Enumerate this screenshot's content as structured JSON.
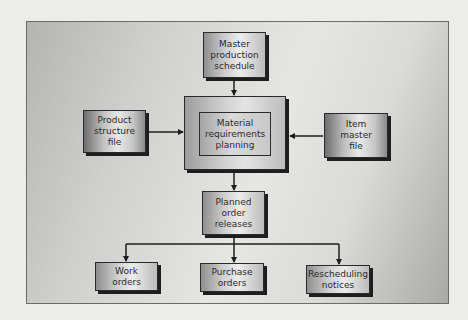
{
  "diagram": {
    "type": "flowchart",
    "title": "",
    "nodes": [
      {
        "id": "mps",
        "label": "Master\nproduction\nschedule"
      },
      {
        "id": "mrp",
        "label": "Material\nrequirements\nplanning"
      },
      {
        "id": "psf",
        "label": "Product\nstructure\nfile"
      },
      {
        "id": "imf",
        "label": "Item\nmaster\nfile"
      },
      {
        "id": "por",
        "label": "Planned\norder\nreleases"
      },
      {
        "id": "wo",
        "label": "Work\norders"
      },
      {
        "id": "po",
        "label": "Purchase\norders"
      },
      {
        "id": "rn",
        "label": "Rescheduling\nnotices"
      }
    ],
    "edges": [
      {
        "from": "mps",
        "to": "mrp"
      },
      {
        "from": "psf",
        "to": "mrp"
      },
      {
        "from": "imf",
        "to": "mrp"
      },
      {
        "from": "mrp",
        "to": "por"
      },
      {
        "from": "por",
        "to": "wo"
      },
      {
        "from": "por",
        "to": "po"
      },
      {
        "from": "por",
        "to": "rn"
      }
    ]
  },
  "labels": {
    "mps": "Master\nproduction\nschedule",
    "mrp": "Material\nrequirements\nplanning",
    "psf": "Product\nstructure\nfile",
    "imf": "Item\nmaster\nfile",
    "por": "Planned\norder\nreleases",
    "wo": "Work\norders",
    "po": "Purchase\norders",
    "rn": "Rescheduling\nnotices"
  },
  "colors": {
    "line": "#1e1e1e",
    "page_background": "#ececea"
  }
}
